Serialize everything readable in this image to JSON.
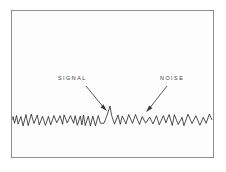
{
  "figure": {
    "name": "signal-and-noise-waveform",
    "background_color": "#ffffff",
    "plot_background_color": "#fdfdfd",
    "frame_color": "#8b8e92",
    "trace_color": "#1a1a1a",
    "annotation_color": "#3a3a3a"
  },
  "annotations": {
    "signal": {
      "label": "SIGNAL",
      "arrow_from": [
        86,
        86
      ],
      "arrow_to": [
        107,
        111
      ]
    },
    "noise": {
      "label": "NOISE",
      "arrow_from": [
        167,
        86
      ],
      "arrow_to": [
        146,
        112
      ]
    }
  },
  "chart_data": {
    "type": "line",
    "title": "",
    "xlabel": "",
    "ylabel": "",
    "grid": false,
    "legend_position": "none",
    "baseline_y": 120,
    "x_start": 13,
    "x_end": 212,
    "annotations": [
      "SIGNAL",
      "NOISE"
    ],
    "segments": [
      {
        "name": "noise-left",
        "x_start": 13,
        "x_end": 103,
        "amplitude": 6.0,
        "period": 2.4,
        "description": "dense low-amplitude random noise"
      },
      {
        "name": "signal-peak",
        "x_start": 103,
        "x_end": 118,
        "amplitude": 15.0,
        "peak_x": 110,
        "peak_y": 106,
        "description": "tall narrow triangular signal spike"
      },
      {
        "name": "noise-right",
        "x_start": 118,
        "x_end": 212,
        "amplitude": 6.0,
        "period": 3.1,
        "description": "coarser low-amplitude random noise"
      }
    ],
    "series": [
      {
        "name": "amplitude",
        "values": [
          0.22,
          -0.61,
          0.44,
          -0.35,
          0.72,
          -0.48,
          0.31,
          -0.66,
          0.55,
          -0.28,
          0.63,
          -0.52,
          0.38,
          -0.71,
          0.26,
          -0.44,
          0.68,
          -0.33,
          0.49,
          -0.58,
          0.35,
          -0.69,
          0.57,
          -0.41,
          0.24,
          -0.63,
          0.46,
          -0.37,
          0.74,
          -0.5,
          0.29,
          -0.65,
          0.53,
          -0.31,
          0.66,
          -0.55,
          0.4,
          -0.73,
          0.27,
          -0.46,
          0.7,
          -0.34,
          0.51,
          -0.6,
          0.37,
          -0.67,
          0.59,
          -0.43,
          0.25,
          -0.62,
          0.47,
          -0.39,
          0.76,
          -0.49,
          0.3,
          -0.64,
          0.54,
          -0.32,
          0.65,
          -0.56,
          0.42,
          -0.7,
          0.28,
          -0.45,
          0.69,
          -0.36,
          0.52,
          -0.59,
          0.34,
          -0.68,
          0.58,
          -0.42,
          0.23,
          -0.61,
          0.45,
          -0.38,
          0.73,
          -0.47,
          2.5,
          -0.3,
          0.4,
          -0.35,
          0.3,
          -0.62,
          0.5,
          -0.3,
          0.64,
          -0.54,
          0.41,
          -0.72,
          0.26,
          -0.43,
          0.67,
          -0.35,
          0.5,
          -0.57,
          0.36,
          -0.66,
          0.56,
          -0.4,
          0.24,
          -0.6,
          0.48,
          -0.37,
          0.71,
          -0.51,
          0.32,
          -0.63,
          0.55,
          -0.33,
          0.62,
          -0.53,
          0.39,
          -0.74,
          0.29,
          -0.44,
          0.66,
          -0.38,
          0.53,
          -0.58,
          0.35,
          -0.65,
          0.57,
          -0.41,
          0.27,
          -0.59,
          0.44,
          -0.36,
          0.7,
          -0.46
        ]
      }
    ]
  }
}
